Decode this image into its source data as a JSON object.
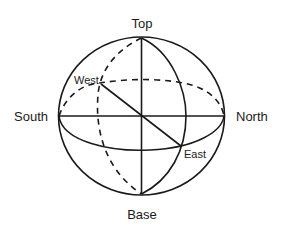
{
  "diagram": {
    "type": "sphere-orientation",
    "labels": {
      "top": "Top",
      "base": "Base",
      "south": "South",
      "north": "North",
      "west": "West",
      "east": "East"
    },
    "colors": {
      "stroke": "#1a1a1a",
      "background": "#ffffff"
    }
  }
}
